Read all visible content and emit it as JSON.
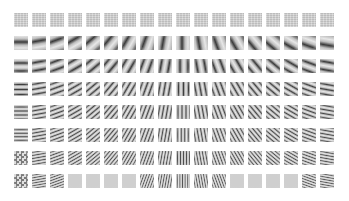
{
  "figure": {
    "rows": 8,
    "columns": 18,
    "cell_size_px": 14,
    "col_pitch_px": 18,
    "row_pitch_px": 23,
    "colors": {
      "background": "#ffffff",
      "mid_gray": "#cfcfcf",
      "dark": "#3a3a3a",
      "light": "#f0f0f0"
    },
    "row_specs": [
      {
        "row": 1,
        "type": "flat",
        "period_px": 0,
        "contrast": 0.05
      },
      {
        "row": 2,
        "type": "grating",
        "period_px": 12,
        "contrast": 0.85
      },
      {
        "row": 3,
        "type": "grating",
        "period_px": 8,
        "contrast": 0.85
      },
      {
        "row": 4,
        "type": "grating",
        "period_px": 5,
        "contrast": 0.8
      },
      {
        "row": 5,
        "type": "grating",
        "period_px": 4,
        "contrast": 0.75
      },
      {
        "row": 6,
        "type": "grating",
        "period_px": 3.5,
        "contrast": 0.7
      },
      {
        "row": 7,
        "type": "grating",
        "period_px": 3,
        "contrast": 0.65,
        "first_cell_noisy": true
      },
      {
        "row": 8,
        "type": "grating",
        "period_px": 2.6,
        "contrast": 0.6,
        "first_cell_noisy": true,
        "crosshatch": true
      }
    ],
    "column_orientations_deg": [
      90,
      80,
      70,
      60,
      50,
      40,
      30,
      20,
      10,
      0,
      -10,
      -20,
      -30,
      -40,
      -50,
      -60,
      -70,
      -80
    ]
  }
}
